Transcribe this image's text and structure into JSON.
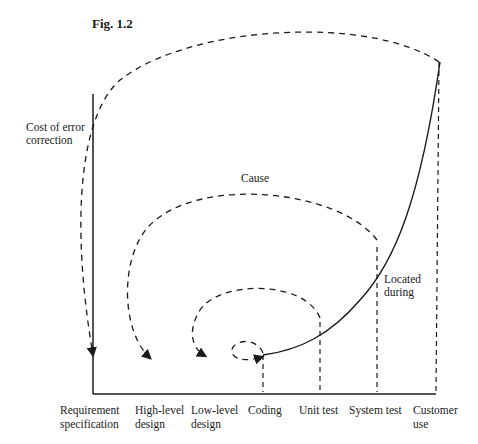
{
  "figure": {
    "title": "Fig. 1.2",
    "y_axis_label_line1": "Cost of error",
    "y_axis_label_line2": "correction",
    "cause_label": "Cause",
    "located_label_line1": "Located",
    "located_label_line2": "during"
  },
  "phases": [
    {
      "line1": "Requirement",
      "line2": "specification"
    },
    {
      "line1": "High-level",
      "line2": "design"
    },
    {
      "line1": "Low-level",
      "line2": "design"
    },
    {
      "line1": "Coding",
      "line2": ""
    },
    {
      "line1": "Unit test",
      "line2": ""
    },
    {
      "line1": "System test",
      "line2": ""
    },
    {
      "line1": "Customer",
      "line2": "use"
    }
  ],
  "colors": {
    "ink": "#1a1a1a",
    "background": "#ffffff"
  }
}
